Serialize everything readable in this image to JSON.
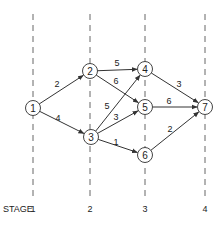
{
  "diagram": {
    "type": "staged-network",
    "stage_word": "STAGE",
    "stages": [
      {
        "label": "1",
        "x": 33
      },
      {
        "label": "2",
        "x": 90
      },
      {
        "label": "3",
        "x": 145
      },
      {
        "label": "4",
        "x": 205
      }
    ],
    "nodes": [
      {
        "id": "1",
        "label": "1",
        "x": 33,
        "y": 108
      },
      {
        "id": "2",
        "label": "2",
        "x": 90,
        "y": 71
      },
      {
        "id": "3",
        "label": "3",
        "x": 91,
        "y": 137
      },
      {
        "id": "4",
        "label": "4",
        "x": 145,
        "y": 69
      },
      {
        "id": "5",
        "label": "5",
        "x": 145,
        "y": 107
      },
      {
        "id": "6",
        "label": "6",
        "x": 145,
        "y": 155
      },
      {
        "id": "7",
        "label": "7",
        "x": 205,
        "y": 107
      }
    ],
    "edges": [
      {
        "from": "1",
        "to": "2",
        "weight": "2",
        "lx": 57,
        "ly": 84
      },
      {
        "from": "1",
        "to": "3",
        "weight": "4",
        "lx": 58,
        "ly": 118
      },
      {
        "from": "2",
        "to": "4",
        "weight": "5",
        "lx": 117,
        "ly": 63
      },
      {
        "from": "2",
        "to": "5",
        "weight": "6",
        "lx": 116,
        "ly": 81
      },
      {
        "from": "3",
        "to": "4",
        "weight": "5",
        "lx": 107,
        "ly": 106
      },
      {
        "from": "3",
        "to": "5",
        "weight": "3",
        "lx": 116,
        "ly": 117
      },
      {
        "from": "3",
        "to": "6",
        "weight": "1",
        "lx": 116,
        "ly": 142
      },
      {
        "from": "4",
        "to": "7",
        "weight": "3",
        "lx": 179,
        "ly": 84
      },
      {
        "from": "5",
        "to": "7",
        "weight": "6",
        "lx": 169,
        "ly": 101
      },
      {
        "from": "6",
        "to": "7",
        "weight": "2",
        "lx": 170,
        "ly": 129
      }
    ]
  }
}
